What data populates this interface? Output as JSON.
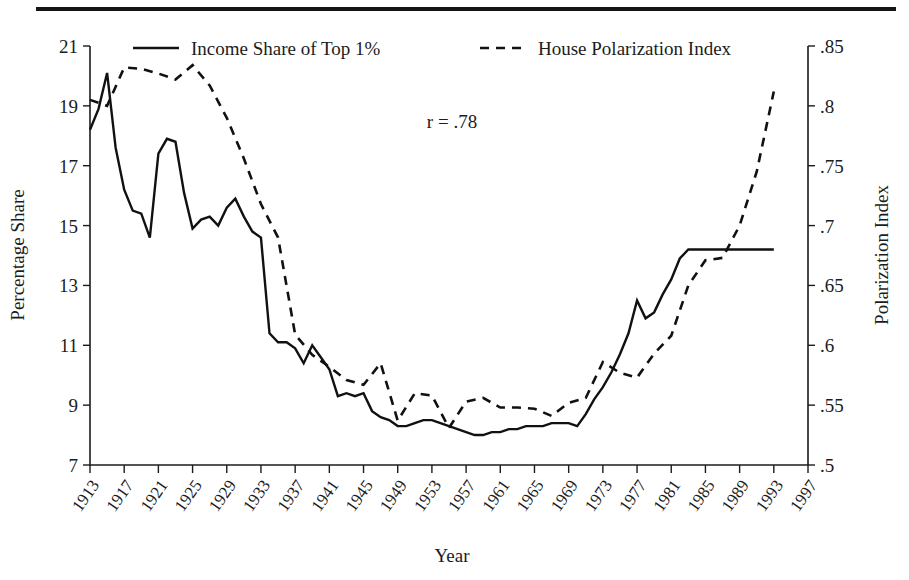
{
  "figure": {
    "has_top_rule": true,
    "background_color": "#ffffff",
    "ink_color": "#111111"
  },
  "annotation": {
    "correlation_text": "r = .78"
  },
  "legend": [
    {
      "label": "Income Share of Top 1%",
      "style": "solid"
    },
    {
      "label": "House Polarization Index",
      "style": "dashed"
    }
  ],
  "chart_data": {
    "type": "line",
    "title": "",
    "xlabel": "Year",
    "ylabel": "Percentage Share",
    "y2label": "Polarization Index",
    "grid": false,
    "legend_position": "top",
    "xlim": [
      1913,
      1997
    ],
    "xticks": [
      1913,
      1917,
      1921,
      1925,
      1929,
      1933,
      1937,
      1941,
      1945,
      1949,
      1953,
      1957,
      1961,
      1965,
      1969,
      1973,
      1977,
      1981,
      1985,
      1989,
      1993,
      1997
    ],
    "xtick_labels": [
      "1913",
      "1917",
      "1921",
      "1925",
      "1929",
      "1933",
      "1937",
      "1941",
      "1945",
      "1949",
      "1953",
      "1957",
      "1961",
      "1965",
      "1969",
      "1973",
      "1977",
      "1981",
      "1985",
      "1989",
      "1993",
      "1997"
    ],
    "ylim": [
      7,
      21
    ],
    "yticks": [
      7,
      9,
      11,
      13,
      15,
      17,
      19,
      21
    ],
    "ytick_labels": [
      "7",
      "9",
      "11",
      "13",
      "15",
      "17",
      "19",
      "21"
    ],
    "y2lim": [
      0.5,
      0.85
    ],
    "y2ticks": [
      0.5,
      0.55,
      0.6,
      0.65,
      0.7,
      0.75,
      0.8,
      0.85
    ],
    "y2tick_labels": [
      ".5",
      ".55",
      ".6",
      ".65",
      ".7",
      ".75",
      ".8",
      ".85"
    ],
    "series": [
      {
        "name": "Income Share of Top 1%",
        "style": "solid",
        "axis": "left",
        "x": [
          1913,
          1914,
          1915,
          1916,
          1917,
          1918,
          1919,
          1920,
          1921,
          1922,
          1923,
          1924,
          1925,
          1926,
          1927,
          1928,
          1929,
          1930,
          1931,
          1932,
          1933,
          1934,
          1935,
          1936,
          1937,
          1938,
          1939,
          1940,
          1941,
          1942,
          1943,
          1944,
          1945,
          1946,
          1947,
          1948,
          1949,
          1950,
          1951,
          1952,
          1953,
          1954,
          1955,
          1956,
          1957,
          1958,
          1959,
          1960,
          1961,
          1962,
          1963,
          1964,
          1965,
          1966,
          1967,
          1968,
          1969,
          1970,
          1971,
          1972,
          1973,
          1974,
          1975,
          1976,
          1977,
          1978,
          1979,
          1980,
          1981,
          1982,
          1983,
          1984,
          1985,
          1986,
          1987,
          1988,
          1989,
          1990,
          1991,
          1992,
          1993
        ],
        "values": [
          18.2,
          18.9,
          20.1,
          17.6,
          16.2,
          15.5,
          15.4,
          14.6,
          17.4,
          17.9,
          17.8,
          16.1,
          14.9,
          15.2,
          15.3,
          15.0,
          15.6,
          15.9,
          15.3,
          14.8,
          14.6,
          11.4,
          11.1,
          11.1,
          10.9,
          10.4,
          11.0,
          10.6,
          10.2,
          9.3,
          9.4,
          9.3,
          9.4,
          8.8,
          8.6,
          8.5,
          8.3,
          8.3,
          8.4,
          8.5,
          8.5,
          8.4,
          8.3,
          8.2,
          8.1,
          8.0,
          8.0,
          8.1,
          8.1,
          8.2,
          8.2,
          8.3,
          8.3,
          8.3,
          8.4,
          8.4,
          8.4,
          8.3,
          8.7,
          9.2,
          9.6,
          10.1,
          10.7,
          11.4,
          12.5,
          11.9,
          12.1,
          12.7,
          13.2,
          13.9,
          14.2,
          14.2,
          14.2,
          14.2,
          14.2,
          14.2,
          14.2,
          14.2,
          14.2,
          14.2,
          14.2
        ]
      },
      {
        "name": "House Polarization Index",
        "style": "dashed",
        "axis": "right",
        "x": [
          1913,
          1915,
          1917,
          1919,
          1921,
          1923,
          1925,
          1927,
          1929,
          1931,
          1933,
          1935,
          1937,
          1939,
          1941,
          1943,
          1945,
          1947,
          1949,
          1951,
          1953,
          1955,
          1957,
          1959,
          1961,
          1963,
          1965,
          1967,
          1969,
          1971,
          1973,
          1975,
          1977,
          1979,
          1981,
          1983,
          1985,
          1987,
          1989,
          1991,
          1993
        ],
        "values": [
          0.805,
          0.8,
          0.832,
          0.831,
          0.827,
          0.822,
          0.834,
          0.817,
          0.79,
          0.756,
          0.718,
          0.69,
          0.609,
          0.592,
          0.582,
          0.571,
          0.567,
          0.585,
          0.537,
          0.56,
          0.558,
          0.531,
          0.553,
          0.556,
          0.548,
          0.548,
          0.547,
          0.541,
          0.552,
          0.556,
          0.586,
          0.577,
          0.573,
          0.593,
          0.608,
          0.65,
          0.671,
          0.673,
          0.7,
          0.745,
          0.812
        ]
      }
    ]
  }
}
